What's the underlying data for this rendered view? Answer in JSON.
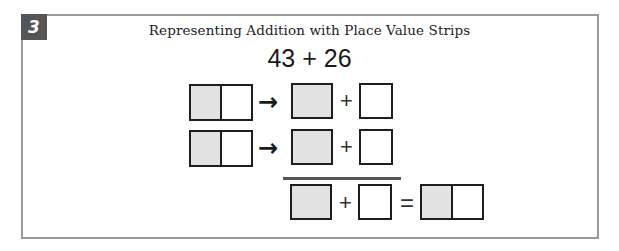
{
  "problem": {
    "number": "3",
    "title": "Representing Addition with Place Value Strips",
    "expression": "43 + 26"
  },
  "rows": [
    {
      "arrow": "→",
      "plus": "+"
    },
    {
      "arrow": "→",
      "plus": "+"
    }
  ],
  "result_row": {
    "plus": "+",
    "equals": "="
  },
  "colors": {
    "tens_fill": "#e2e2e2",
    "ones_fill": "#ffffff",
    "border": "#1e1e1e",
    "frame": "#9a9a9a",
    "badge": "#555555"
  }
}
